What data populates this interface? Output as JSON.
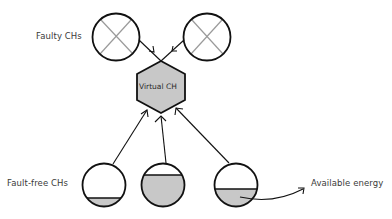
{
  "labels": {
    "faulty": "Faulty CHs",
    "fault_free": "Fault-free CHs",
    "virtual": "Virtual CH",
    "energy": "Available energy"
  },
  "colors": {
    "stroke": "#111111",
    "fill_gray": "#c8c8c8",
    "cross": "#9a9a9a",
    "text": "#3a3a3a"
  },
  "nodes": {
    "faulty_chs": [
      {
        "id": "faulty-ch-1",
        "state": "faulty"
      },
      {
        "id": "faulty-ch-2",
        "state": "faulty"
      }
    ],
    "virtual_ch": {
      "id": "virtual-ch",
      "shape": "hexagon"
    },
    "fault_free_chs": [
      {
        "id": "fault-free-ch-1",
        "energy_level": "low"
      },
      {
        "id": "fault-free-ch-2",
        "energy_level": "high"
      },
      {
        "id": "fault-free-ch-3",
        "energy_level": "medium"
      }
    ]
  },
  "edges": [
    {
      "from": "faulty-ch-1",
      "to": "virtual-ch"
    },
    {
      "from": "faulty-ch-2",
      "to": "virtual-ch"
    },
    {
      "from": "fault-free-ch-1",
      "to": "virtual-ch"
    },
    {
      "from": "fault-free-ch-2",
      "to": "virtual-ch"
    },
    {
      "from": "fault-free-ch-3",
      "to": "virtual-ch"
    }
  ]
}
